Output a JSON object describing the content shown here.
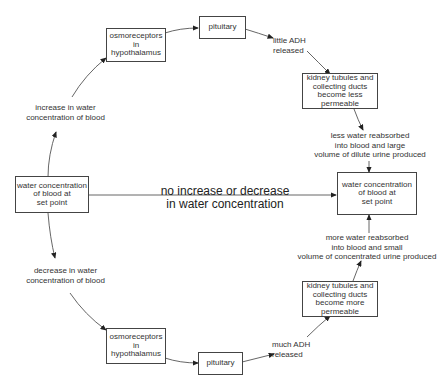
{
  "diagram": {
    "left_node": "water concentration\nof blood at\nset point",
    "right_node": "water concentration\nof blood at\nset point",
    "center_label": "no increase or decrease\nin water concentration",
    "top_branch": {
      "trigger": "increase in water\nconcentration of blood",
      "osmoreceptors": "osmoreceptors\nin hypothalamus",
      "pituitary": "pituitary",
      "hormone": "little ADH\nreleased",
      "kidney": "kidney tubules and\ncollecting ducts\nbecome less\npermeable",
      "outcome": "less water reabsorbed\ninto blood and large\nvolume of dilute urine produced"
    },
    "bottom_branch": {
      "trigger": "decrease in water\nconcentration of blood",
      "osmoreceptors": "osmoreceptors\nin\nhypothalamus",
      "pituitary": "pituitary",
      "hormone": "much ADH\nreleased",
      "kidney": "kidney tubules and\ncollecting ducts\nbecome more\npermeable",
      "outcome": "more water reabsorbed\ninto blood and small\nvolume of concentrated urine produced"
    }
  }
}
